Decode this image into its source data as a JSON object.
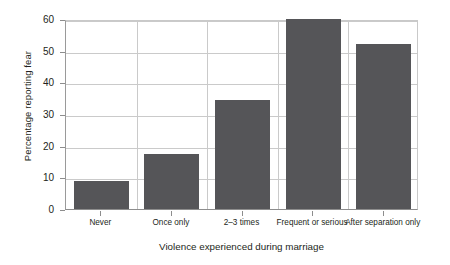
{
  "chart_data": {
    "type": "bar",
    "title": "",
    "subtitle": "",
    "xlabel": "Violence experienced during marriage",
    "ylabel": "Percentage reporting fear",
    "categories": [
      "Never",
      "Once only",
      "2–3 times",
      "Frequent or serious",
      "After separation only"
    ],
    "values": [
      9,
      17.5,
      34.5,
      60,
      52
    ],
    "ylim": [
      0,
      60
    ],
    "ytick_labels": [
      "0",
      "10",
      "20",
      "30",
      "40",
      "50",
      "60"
    ],
    "ytick_values": [
      0,
      10,
      20,
      30,
      40,
      50,
      60
    ],
    "grid": "horizontal and vertical category separators",
    "legend": "none",
    "bar_color": "#555558",
    "gridline_color": "#cacaca",
    "axis_color": "#8d8d8d",
    "background_color": "#ffffff",
    "text_color": "#231f20"
  }
}
